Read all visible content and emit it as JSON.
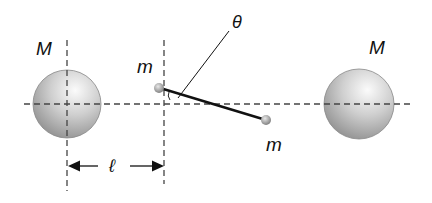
{
  "diagram": {
    "labels": {
      "big_mass_left": "M",
      "big_mass_right": "M",
      "small_mass_top": "m",
      "small_mass_bottom": "m",
      "angle": "θ",
      "distance": "ℓ"
    },
    "colors": {
      "sphere_light": "#f2f2f2",
      "sphere_dark": "#8c8c8c",
      "line": "#111111",
      "dashed": "#444444"
    }
  }
}
